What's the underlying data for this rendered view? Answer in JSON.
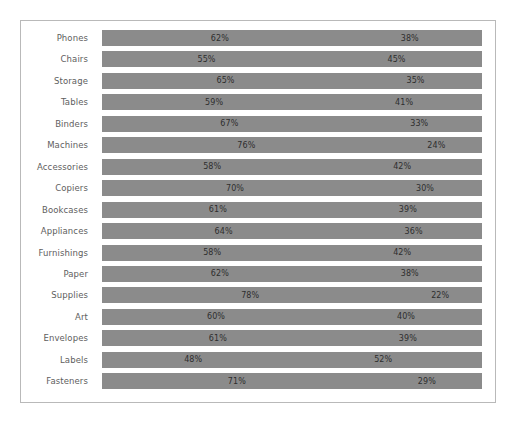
{
  "chart_data": {
    "type": "bar",
    "subtype": "100% stacked horizontal bar",
    "title": "",
    "subtitle": "",
    "xlabel": "",
    "ylabel": "",
    "xlim": [
      0,
      100
    ],
    "grid": false,
    "legend": "none",
    "axis_visible": false,
    "orientation": "horizontal",
    "value_suffix": "%",
    "categories": [
      "Phones",
      "Chairs",
      "Storage",
      "Tables",
      "Binders",
      "Machines",
      "Accessories",
      "Copiers",
      "Bookcases",
      "Appliances",
      "Furnishings",
      "Paper",
      "Supplies",
      "Art",
      "Envelopes",
      "Labels",
      "Fasteners"
    ],
    "series": [
      {
        "name": "Primary",
        "color": "#8b8b8b",
        "values": [
          62,
          55,
          65,
          59,
          67,
          76,
          58,
          70,
          61,
          64,
          58,
          62,
          78,
          60,
          61,
          48,
          71
        ],
        "labels": [
          "62%",
          "55%",
          "65%",
          "59%",
          "67%",
          "76%",
          "58%",
          "70%",
          "61%",
          "64%",
          "58%",
          "62%",
          "78%",
          "60%",
          "61%",
          "48%",
          "71%"
        ]
      },
      {
        "name": "Secondary",
        "color": "#8b8b8b",
        "values": [
          38,
          45,
          35,
          41,
          33,
          24,
          42,
          30,
          39,
          36,
          42,
          38,
          22,
          40,
          39,
          52,
          29
        ],
        "labels": [
          "38%",
          "45%",
          "35%",
          "41%",
          "33%",
          "24%",
          "42%",
          "30%",
          "39%",
          "36%",
          "42%",
          "38%",
          "22%",
          "40%",
          "39%",
          "52%",
          "29%"
        ]
      }
    ],
    "rows": [
      {
        "category": "Phones",
        "primary_value": 62,
        "primary_label": "62%",
        "secondary_value": 38,
        "secondary_label": "38%"
      },
      {
        "category": "Chairs",
        "primary_value": 55,
        "primary_label": "55%",
        "secondary_value": 45,
        "secondary_label": "45%"
      },
      {
        "category": "Storage",
        "primary_value": 65,
        "primary_label": "65%",
        "secondary_value": 35,
        "secondary_label": "35%"
      },
      {
        "category": "Tables",
        "primary_value": 59,
        "primary_label": "59%",
        "secondary_value": 41,
        "secondary_label": "41%"
      },
      {
        "category": "Binders",
        "primary_value": 67,
        "primary_label": "67%",
        "secondary_value": 33,
        "secondary_label": "33%"
      },
      {
        "category": "Machines",
        "primary_value": 76,
        "primary_label": "76%",
        "secondary_value": 24,
        "secondary_label": "24%"
      },
      {
        "category": "Accessories",
        "primary_value": 58,
        "primary_label": "58%",
        "secondary_value": 42,
        "secondary_label": "42%"
      },
      {
        "category": "Copiers",
        "primary_value": 70,
        "primary_label": "70%",
        "secondary_value": 30,
        "secondary_label": "30%"
      },
      {
        "category": "Bookcases",
        "primary_value": 61,
        "primary_label": "61%",
        "secondary_value": 39,
        "secondary_label": "39%"
      },
      {
        "category": "Appliances",
        "primary_value": 64,
        "primary_label": "64%",
        "secondary_value": 36,
        "secondary_label": "36%"
      },
      {
        "category": "Furnishings",
        "primary_value": 58,
        "primary_label": "58%",
        "secondary_value": 42,
        "secondary_label": "42%"
      },
      {
        "category": "Paper",
        "primary_value": 62,
        "primary_label": "62%",
        "secondary_value": 38,
        "secondary_label": "38%"
      },
      {
        "category": "Supplies",
        "primary_value": 78,
        "primary_label": "78%",
        "secondary_value": 22,
        "secondary_label": "22%"
      },
      {
        "category": "Art",
        "primary_value": 60,
        "primary_label": "60%",
        "secondary_value": 40,
        "secondary_label": "40%"
      },
      {
        "category": "Envelopes",
        "primary_value": 61,
        "primary_label": "61%",
        "secondary_value": 39,
        "secondary_label": "39%"
      },
      {
        "category": "Labels",
        "primary_value": 48,
        "primary_label": "48%",
        "secondary_value": 52,
        "secondary_label": "52%"
      },
      {
        "category": "Fasteners",
        "primary_value": 71,
        "primary_label": "71%",
        "secondary_value": 29,
        "secondary_label": "29%"
      }
    ]
  },
  "style": {
    "bar_color": "#8b8b8b",
    "frame_color": "#b9b9b9",
    "background": "#ffffff",
    "label_color": "#5e5e5e",
    "value_color": "#2e2e2e"
  }
}
